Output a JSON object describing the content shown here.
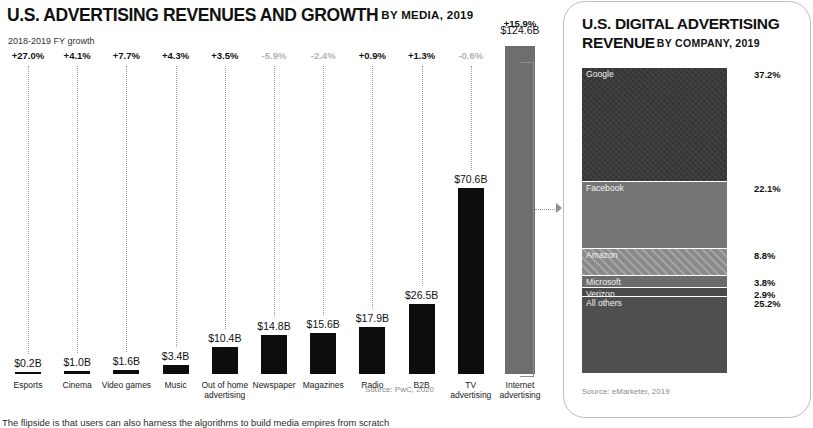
{
  "left": {
    "title_main": "U.S. ADVERTISING REVENUES AND GROWTH",
    "title_sub": "BY MEDIA, 2019",
    "growth_caption": "2018-2019 FY growth",
    "source": "Source: PwC, 2020"
  },
  "right": {
    "title_main": "U.S. DIGITAL ADVERTISING REVENUE",
    "title_sub": "BY COMPANY, 2019",
    "source": "Source: eMarketer, 2019"
  },
  "footer": {
    "text": "The flipside is that users can also harness the algorithms to build media empires from scratch"
  },
  "colors": {
    "bar_black": "#0d0d0d",
    "bar_gray": "#6e6e6e",
    "growth_positive": "#111111",
    "growth_negative": "#b3b3b3",
    "google": "#3a3a3a",
    "facebook": "#757575",
    "amazon": "#8a8a8a",
    "microsoft": "#6b6b6b",
    "verizon": "#4a4a4a",
    "all_others": "#4f4f4f"
  },
  "chart_data": [
    {
      "type": "bar",
      "title": "U.S. ADVERTISING REVENUES AND GROWTH",
      "subtitle": "BY MEDIA, 2019",
      "xlabel": "",
      "ylabel": "Revenue (USD billions)",
      "ylim": [
        0,
        124.6
      ],
      "grid": false,
      "legend": "none",
      "source": "Source: PwC, 2020",
      "annotation_row_label": "2018-2019 FY growth",
      "categories": [
        "Esports",
        "Cinema",
        "Video games",
        "Music",
        "Out of home\nadvertising",
        "Newspaper",
        "Magazines",
        "Radio",
        "B2B",
        "TV\nadvertising",
        "Internet\nadvertising"
      ],
      "values": [
        0.2,
        1.0,
        1.6,
        3.4,
        10.4,
        14.8,
        15.6,
        17.9,
        26.5,
        70.6,
        124.6
      ],
      "value_labels": [
        "$0.2B",
        "$1.0B",
        "$1.6B",
        "$3.4B",
        "$10.4B",
        "$14.8B",
        "$15.6B",
        "$17.9B",
        "$26.5B",
        "$70.6B",
        "$124.6B"
      ],
      "growth": [
        27.0,
        4.1,
        7.7,
        4.3,
        3.5,
        -5.9,
        -2.4,
        0.9,
        1.3,
        -0.6,
        15.9
      ],
      "growth_labels": [
        "+27.0%",
        "+4.1%",
        "+7.7%",
        "+4.3%",
        "+3.5%",
        "-5.9%",
        "-2.4%",
        "+0.9%",
        "+1.3%",
        "-0.6%",
        "+15.9%"
      ],
      "bar_colors": [
        "#0d0d0d",
        "#0d0d0d",
        "#0d0d0d",
        "#0d0d0d",
        "#0d0d0d",
        "#0d0d0d",
        "#0d0d0d",
        "#0d0d0d",
        "#0d0d0d",
        "#0d0d0d",
        "#6e6e6e"
      ]
    },
    {
      "type": "bar",
      "orientation": "stacked-vertical",
      "title": "U.S. DIGITAL ADVERTISING REVENUE",
      "subtitle": "BY COMPANY, 2019",
      "source": "Source: eMarketer, 2019",
      "categories": [
        "Google",
        "Facebook",
        "Amazon",
        "Microsoft",
        "Verizon",
        "All others"
      ],
      "values": [
        37.2,
        22.1,
        8.8,
        3.8,
        2.9,
        25.2
      ],
      "value_labels": [
        "37.2%",
        "22.1%",
        "8.8%",
        "3.8%",
        "2.9%",
        "25.2%"
      ],
      "segment_colors": [
        "#3a3a3a",
        "#757575",
        "#8a8a8a",
        "#6b6b6b",
        "#4a4a4a",
        "#4f4f4f"
      ],
      "segment_patterns": [
        "crosshatch",
        "solid",
        "diagonal-stripes",
        "solid",
        "solid",
        "solid"
      ],
      "ylim": [
        0,
        100
      ],
      "ylabel": "Share of digital ad revenue (%)"
    }
  ]
}
